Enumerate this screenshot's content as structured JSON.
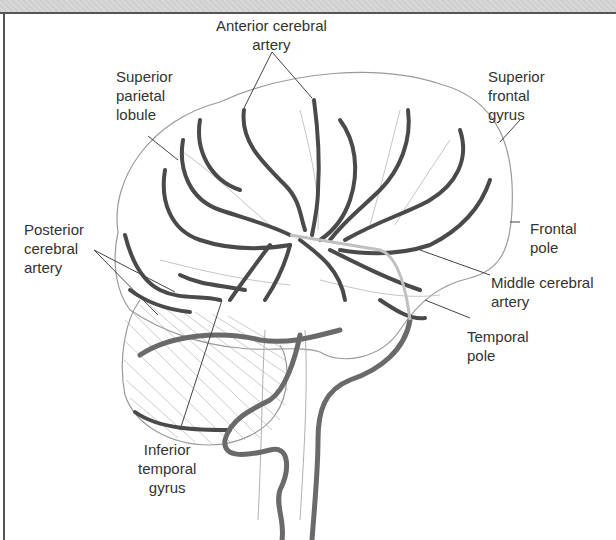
{
  "figure": {
    "labels": {
      "anterior_cerebral_artery": "Anterior cerebral\nartery",
      "superior_parietal_lobule": "Superior\nparietal\nlobule",
      "superior_frontal_gyrus": "Superior\nfrontal\ngyrus",
      "posterior_cerebral_artery": "Posterior\ncerebral\nartery",
      "frontal_pole": "Frontal\npole",
      "middle_cerebral_artery": "Middle cerebral\nartery",
      "temporal_pole": "Temporal\npole",
      "inferior_temporal_gyrus": "Inferior\ntemporal\ngyrus"
    },
    "colors": {
      "vessel": "#4a4a4a",
      "vessel_light": "#9a9a9a",
      "outline": "#9a9a9a",
      "leader_line": "#444444",
      "text": "#333333",
      "frame": "#555555"
    }
  }
}
